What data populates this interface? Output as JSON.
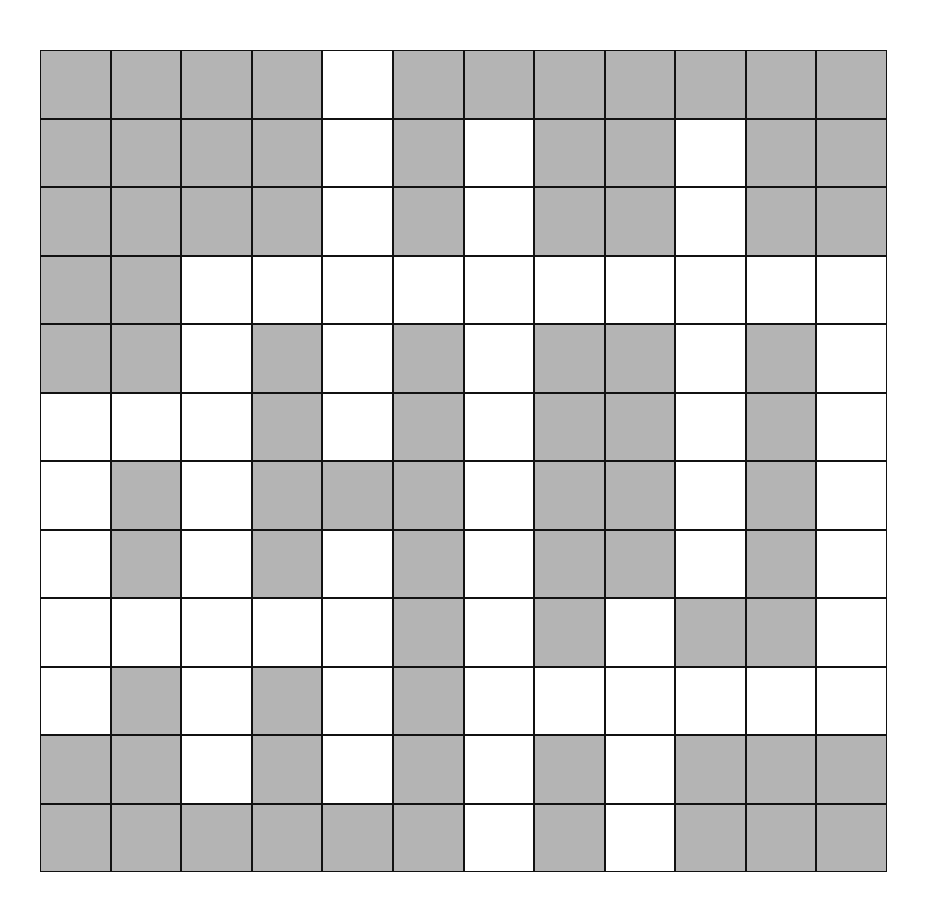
{
  "grid": {
    "rows": 12,
    "cols": 12,
    "colors": {
      "shaded": "#b4b4b4",
      "empty": "#ffffff",
      "line": "#111111"
    },
    "legend": "1 = shaded (gray), 0 = empty (white)",
    "cells": [
      [
        1,
        1,
        1,
        1,
        0,
        1,
        1,
        1,
        1,
        1,
        1,
        1
      ],
      [
        1,
        1,
        1,
        1,
        0,
        1,
        0,
        1,
        1,
        0,
        1,
        1
      ],
      [
        1,
        1,
        1,
        1,
        0,
        1,
        0,
        1,
        1,
        0,
        1,
        1
      ],
      [
        1,
        1,
        0,
        0,
        0,
        0,
        0,
        0,
        0,
        0,
        0,
        0
      ],
      [
        1,
        1,
        0,
        1,
        0,
        1,
        0,
        1,
        1,
        0,
        1,
        0
      ],
      [
        0,
        0,
        0,
        1,
        0,
        1,
        0,
        1,
        1,
        0,
        1,
        0
      ],
      [
        0,
        1,
        0,
        1,
        1,
        1,
        0,
        1,
        1,
        0,
        1,
        0
      ],
      [
        0,
        1,
        0,
        1,
        0,
        1,
        0,
        1,
        1,
        0,
        1,
        0
      ],
      [
        0,
        0,
        0,
        0,
        0,
        1,
        0,
        1,
        0,
        1,
        1,
        0
      ],
      [
        0,
        1,
        0,
        1,
        0,
        1,
        0,
        0,
        0,
        0,
        0,
        0
      ],
      [
        1,
        1,
        0,
        1,
        0,
        1,
        0,
        1,
        0,
        1,
        1,
        1
      ],
      [
        1,
        1,
        1,
        1,
        1,
        1,
        0,
        1,
        0,
        1,
        1,
        1
      ]
    ]
  }
}
